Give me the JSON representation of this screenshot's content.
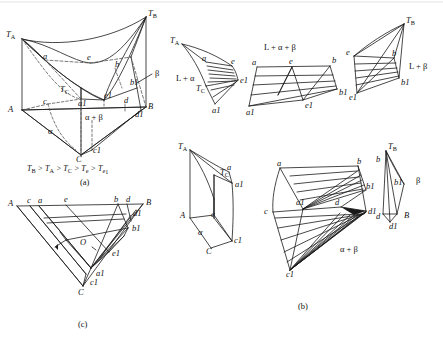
{
  "figure": {
    "domain": "Diagram",
    "kind": "ternary-phase-diagram",
    "background": "#ffffff",
    "line_color": "#1a1a1a",
    "dash_color": "#555555"
  },
  "panels": {
    "a": {
      "caption": "(a)",
      "inequality": "T_B > T_A > T_C > T_e > T_e1",
      "inequality_parts": [
        "T",
        "B",
        " > ",
        "T",
        "A",
        " > ",
        "T",
        "C",
        " > ",
        "T",
        "e",
        " > ",
        "T",
        "e",
        "1"
      ],
      "vertices": {
        "TA": "T",
        "TA_sub": "A",
        "TB": "T",
        "TB_sub": "B",
        "TC": "T",
        "TC_sub": "C",
        "A": "A",
        "B": "B",
        "C": "C"
      },
      "points": [
        "a",
        "b",
        "c",
        "d",
        "e",
        "a1",
        "b1",
        "c1",
        "d1",
        "e1"
      ],
      "regions": [
        "α + β",
        "β",
        "α"
      ]
    },
    "b": {
      "caption": "(b)",
      "solids": [
        {
          "name": "L + α",
          "label": "L + α",
          "vertices": [
            "TA",
            "TC",
            "a",
            "e",
            "a1",
            "e1"
          ]
        },
        {
          "name": "L + α + β",
          "label": "L + α + β",
          "vertices": [
            "a",
            "e",
            "b",
            "a1",
            "e1",
            "b1"
          ]
        },
        {
          "name": "L + β",
          "label": "L + β",
          "vertices": [
            "TB",
            "e",
            "b",
            "e1",
            "b1"
          ]
        },
        {
          "name": "alpha-solid",
          "label": "α",
          "vertices": [
            "TA",
            "A",
            "C",
            "TC",
            "a",
            "c",
            "a1",
            "c1"
          ]
        },
        {
          "name": "alpha+beta-solid",
          "label": "α + β",
          "vertices": [
            "a",
            "b",
            "c",
            "d",
            "a1",
            "b1",
            "c1",
            "d1"
          ]
        },
        {
          "name": "beta-solid",
          "label": "β",
          "vertices": [
            "TB",
            "B",
            "b",
            "d",
            "b1",
            "d1"
          ]
        }
      ],
      "labels": {
        "TA": "T",
        "TA_sub": "A",
        "TB": "T",
        "TB_sub": "B",
        "TC": "T",
        "TC_sub": "C",
        "A": "A",
        "B": "B",
        "C": "C"
      }
    },
    "c": {
      "caption": "(c)",
      "corners": [
        "A",
        "B",
        "C"
      ],
      "points": [
        "a",
        "b",
        "c",
        "d",
        "e",
        "a1",
        "b1",
        "c1",
        "d1",
        "e1",
        "O"
      ],
      "center_point": "O"
    }
  },
  "glyphs": {
    "alpha": "α",
    "beta": "β",
    "gt": ">",
    "plus": "+",
    "L": "L"
  }
}
